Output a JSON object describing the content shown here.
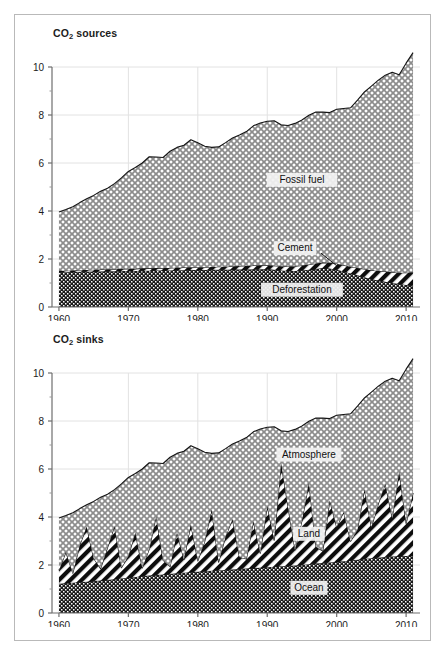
{
  "figure": {
    "background": "#ffffff",
    "frame_color": "#b9b9b9"
  },
  "panels": [
    {
      "id": "sources",
      "title_main": "CO",
      "title_sub": "2",
      "title_tail": " sources"
    },
    {
      "id": "sinks",
      "title_main": "CO",
      "title_sub": "2",
      "title_tail": " sinks"
    }
  ],
  "chart_data": [
    {
      "type": "area",
      "id": "co2-sources",
      "title": "CO2 sources",
      "xlabel": "",
      "ylabel": "",
      "xlim": [
        1959,
        2012
      ],
      "ylim": [
        0,
        10
      ],
      "xticks": [
        1960,
        1970,
        1980,
        1990,
        2000,
        2010
      ],
      "yticks": [
        0,
        2,
        4,
        6,
        8,
        10
      ],
      "yticks_minor": [
        1,
        3,
        5,
        7,
        9
      ],
      "grid": true,
      "stacked": true,
      "stack_order_bottom_to_top": [
        "Deforestation",
        "Cement",
        "Fossil fuel"
      ],
      "legend_position": "inline-labels",
      "annotations": [
        {
          "text": "Fossil fuel",
          "x": 1995,
          "y": 5.3
        },
        {
          "text": "Cement",
          "x": 1994,
          "y": 2.45,
          "leader_to": [
            2000,
            1.72
          ]
        },
        {
          "text": "Deforestation",
          "x": 1995,
          "y": 0.72
        }
      ],
      "x": [
        1960,
        1961,
        1962,
        1963,
        1964,
        1965,
        1966,
        1967,
        1968,
        1969,
        1970,
        1971,
        1972,
        1973,
        1974,
        1975,
        1976,
        1977,
        1978,
        1979,
        1980,
        1981,
        1982,
        1983,
        1984,
        1985,
        1986,
        1987,
        1988,
        1989,
        1990,
        1991,
        1992,
        1993,
        1994,
        1995,
        1996,
        1997,
        1998,
        1999,
        2000,
        2001,
        2002,
        2003,
        2004,
        2005,
        2006,
        2007,
        2008,
        2009,
        2010,
        2011
      ],
      "series": [
        {
          "name": "Deforestation",
          "values": [
            1.45,
            1.45,
            1.46,
            1.47,
            1.47,
            1.48,
            1.48,
            1.49,
            1.49,
            1.5,
            1.5,
            1.5,
            1.51,
            1.51,
            1.52,
            1.52,
            1.52,
            1.53,
            1.53,
            1.54,
            1.54,
            1.54,
            1.55,
            1.55,
            1.55,
            1.56,
            1.56,
            1.56,
            1.57,
            1.57,
            1.58,
            1.55,
            1.52,
            1.5,
            1.5,
            1.52,
            1.55,
            1.58,
            1.62,
            1.6,
            1.55,
            1.48,
            1.4,
            1.32,
            1.24,
            1.16,
            1.1,
            1.05,
            1.0,
            0.96,
            0.92,
            0.9
          ]
        },
        {
          "name": "Cement",
          "values": [
            0.06,
            0.06,
            0.06,
            0.07,
            0.07,
            0.07,
            0.08,
            0.08,
            0.08,
            0.09,
            0.09,
            0.09,
            0.1,
            0.1,
            0.1,
            0.1,
            0.11,
            0.11,
            0.12,
            0.12,
            0.12,
            0.12,
            0.12,
            0.13,
            0.13,
            0.14,
            0.15,
            0.15,
            0.16,
            0.17,
            0.17,
            0.17,
            0.18,
            0.19,
            0.2,
            0.21,
            0.22,
            0.23,
            0.23,
            0.24,
            0.25,
            0.26,
            0.28,
            0.31,
            0.34,
            0.37,
            0.4,
            0.43,
            0.45,
            0.47,
            0.51,
            0.55
          ]
        },
        {
          "name": "Fossil fuel",
          "values": [
            2.45,
            2.55,
            2.66,
            2.81,
            2.97,
            3.1,
            3.26,
            3.38,
            3.57,
            3.79,
            4.06,
            4.22,
            4.39,
            4.65,
            4.63,
            4.61,
            4.86,
            5.01,
            5.09,
            5.31,
            5.18,
            5.04,
            4.98,
            4.99,
            5.17,
            5.34,
            5.46,
            5.6,
            5.82,
            5.93,
            5.99,
            6.04,
            5.89,
            5.87,
            5.95,
            6.06,
            6.22,
            6.31,
            6.27,
            6.26,
            6.44,
            6.53,
            6.62,
            6.99,
            7.38,
            7.67,
            7.95,
            8.18,
            8.33,
            8.25,
            8.73,
            9.15
          ]
        }
      ],
      "total_values": [
        3.96,
        4.06,
        4.18,
        4.35,
        4.51,
        4.65,
        4.82,
        4.95,
        5.14,
        5.38,
        5.65,
        5.81,
        6.0,
        6.26,
        6.25,
        6.23,
        6.49,
        6.65,
        6.74,
        6.97,
        6.84,
        6.7,
        6.65,
        6.67,
        6.85,
        7.04,
        7.17,
        7.31,
        7.55,
        7.67,
        7.74,
        7.76,
        7.59,
        7.56,
        7.65,
        7.79,
        7.99,
        8.12,
        8.12,
        8.1,
        8.24,
        8.27,
        8.3,
        8.62,
        8.96,
        9.2,
        9.45,
        9.66,
        9.78,
        9.68,
        10.16,
        10.6
      ]
    },
    {
      "type": "area",
      "id": "co2-sinks",
      "title": "CO2 sinks",
      "xlabel": "",
      "ylabel": "",
      "xlim": [
        1959,
        2012
      ],
      "ylim": [
        0,
        10
      ],
      "xticks": [
        1960,
        1970,
        1980,
        1990,
        2000,
        2010
      ],
      "yticks": [
        0,
        2,
        4,
        6,
        8,
        10
      ],
      "yticks_minor": [
        1,
        3,
        5,
        7,
        9
      ],
      "grid": true,
      "stacked": true,
      "stack_order_bottom_to_top": [
        "Ocean",
        "Land",
        "Atmosphere"
      ],
      "legend_position": "inline-labels",
      "annotations": [
        {
          "text": "Atmosphere",
          "x": 1996,
          "y": 6.6
        },
        {
          "text": "Land",
          "x": 1996,
          "y": 3.3
        },
        {
          "text": "Ocean",
          "x": 1996,
          "y": 1.05
        }
      ],
      "x": [
        1960,
        1961,
        1962,
        1963,
        1964,
        1965,
        1966,
        1967,
        1968,
        1969,
        1970,
        1971,
        1972,
        1973,
        1974,
        1975,
        1976,
        1977,
        1978,
        1979,
        1980,
        1981,
        1982,
        1983,
        1984,
        1985,
        1986,
        1987,
        1988,
        1989,
        1990,
        1991,
        1992,
        1993,
        1994,
        1995,
        1996,
        1997,
        1998,
        1999,
        2000,
        2001,
        2002,
        2003,
        2004,
        2005,
        2006,
        2007,
        2008,
        2009,
        2010,
        2011
      ],
      "series": [
        {
          "name": "Ocean",
          "values": [
            1.22,
            1.24,
            1.26,
            1.28,
            1.3,
            1.33,
            1.35,
            1.38,
            1.41,
            1.44,
            1.47,
            1.5,
            1.53,
            1.56,
            1.58,
            1.6,
            1.63,
            1.66,
            1.68,
            1.7,
            1.72,
            1.74,
            1.76,
            1.77,
            1.79,
            1.81,
            1.83,
            1.85,
            1.87,
            1.89,
            1.91,
            1.93,
            1.95,
            1.96,
            1.98,
            2.0,
            2.03,
            2.06,
            2.08,
            2.1,
            2.13,
            2.16,
            2.19,
            2.22,
            2.25,
            2.28,
            2.3,
            2.33,
            2.35,
            2.36,
            2.38,
            2.4
          ]
        },
        {
          "name": "Land",
          "values": [
            0.55,
            1.3,
            0.4,
            1.55,
            2.3,
            0.95,
            0.5,
            1.35,
            2.2,
            0.45,
            0.9,
            1.85,
            0.35,
            1.1,
            2.45,
            0.6,
            0.3,
            1.7,
            0.55,
            2.0,
            0.45,
            1.25,
            2.55,
            0.35,
            1.4,
            2.1,
            0.5,
            0.4,
            1.95,
            0.6,
            2.55,
            1.1,
            4.3,
            2.45,
            0.65,
            1.85,
            3.4,
            0.7,
            0.5,
            2.6,
            1.45,
            2.05,
            0.8,
            1.25,
            2.9,
            1.3,
            2.25,
            3.05,
            1.6,
            3.55,
            1.35,
            2.6
          ]
        },
        {
          "name": "Atmosphere",
          "values": [
            2.19,
            1.52,
            2.52,
            1.52,
            0.91,
            2.37,
            2.97,
            2.22,
            1.53,
            3.49,
            3.28,
            2.46,
            4.12,
            3.6,
            2.22,
            4.03,
            4.56,
            3.29,
            4.51,
            3.27,
            4.67,
            3.71,
            2.34,
            4.55,
            3.66,
            3.13,
            4.84,
            5.06,
            3.73,
            5.18,
            3.28,
            4.73,
            1.34,
            3.15,
            5.02,
            3.94,
            2.56,
            5.36,
            5.54,
            3.4,
            4.66,
            4.06,
            5.31,
            5.15,
            3.81,
            5.62,
            4.9,
            4.28,
            5.83,
            3.77,
            6.43,
            5.6
          ]
        }
      ],
      "total_values": [
        3.96,
        4.06,
        4.18,
        4.35,
        4.51,
        4.65,
        4.82,
        4.95,
        5.14,
        5.38,
        5.65,
        5.81,
        6.0,
        6.26,
        6.25,
        6.23,
        6.49,
        6.65,
        6.74,
        6.97,
        6.84,
        6.7,
        6.65,
        6.67,
        6.85,
        7.04,
        7.17,
        7.31,
        7.55,
        7.67,
        7.74,
        7.76,
        7.59,
        7.56,
        7.65,
        7.79,
        7.99,
        8.12,
        8.12,
        8.1,
        8.24,
        8.27,
        8.3,
        8.62,
        8.96,
        9.2,
        9.45,
        9.66,
        9.78,
        9.68,
        10.16,
        10.6
      ]
    }
  ]
}
